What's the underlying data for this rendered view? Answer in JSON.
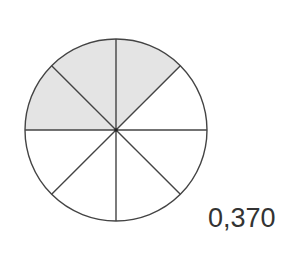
{
  "diagram": {
    "type": "fraction-circle",
    "total_sectors": 8,
    "shaded_sectors": 3,
    "shaded_positions": [
      "north-to-northeast",
      "northwest-to-north",
      "west-to-northwest"
    ],
    "center": [
      116,
      130
    ],
    "radius": 91,
    "colors": {
      "shaded": "#e4e4e4",
      "unshaded": "#ffffff",
      "stroke": "#444444"
    }
  },
  "label": {
    "value": "0,370"
  }
}
